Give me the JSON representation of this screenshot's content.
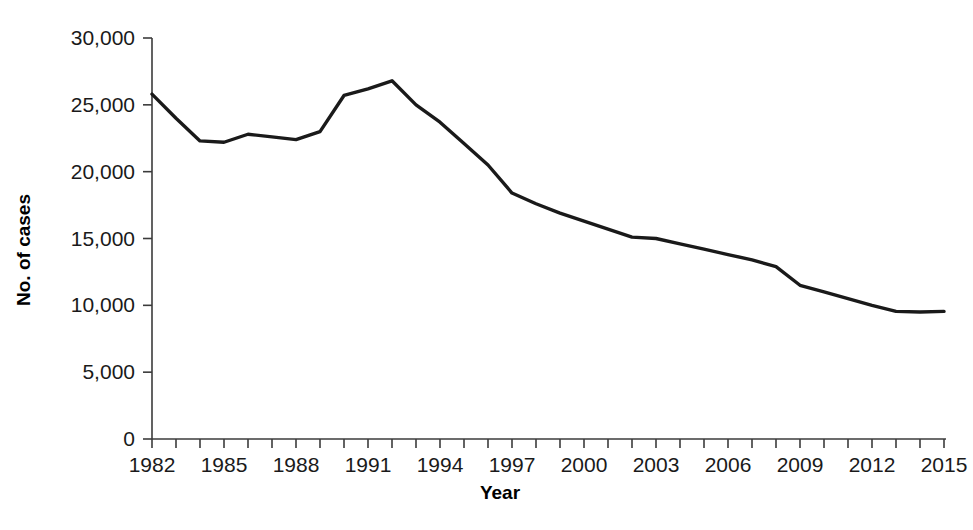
{
  "chart_data": {
    "type": "line",
    "title": "",
    "xlabel": "Year",
    "ylabel": "No. of cases",
    "xlim": [
      1982,
      2015
    ],
    "ylim": [
      0,
      30000
    ],
    "grid": false,
    "legend": null,
    "x_tick_labels": [
      "1982",
      "1985",
      "1988",
      "1991",
      "1994",
      "1997",
      "2000",
      "2003",
      "2006",
      "2009",
      "2012",
      "2015"
    ],
    "x_tick_values": [
      1982,
      1985,
      1988,
      1991,
      1994,
      1997,
      2000,
      2003,
      2006,
      2009,
      2012,
      2015
    ],
    "x_minor_ticks_every": 1,
    "y_tick_labels": [
      "0",
      "5,000",
      "10,000",
      "15,000",
      "20,000",
      "25,000",
      "30,000"
    ],
    "y_tick_values": [
      0,
      5000,
      10000,
      15000,
      20000,
      25000,
      30000
    ],
    "x": [
      1982,
      1983,
      1984,
      1985,
      1986,
      1987,
      1988,
      1989,
      1990,
      1991,
      1992,
      1993,
      1994,
      1995,
      1996,
      1997,
      1998,
      1999,
      2000,
      2001,
      2002,
      2003,
      2004,
      2005,
      2006,
      2007,
      2008,
      2009,
      2010,
      2011,
      2012,
      2013,
      2014,
      2015
    ],
    "series": [
      {
        "name": "No. of cases",
        "color": "#1a1a1a",
        "values": [
          25800,
          24000,
          22300,
          22200,
          22800,
          22600,
          22400,
          23000,
          25700,
          26200,
          26800,
          25000,
          23700,
          22100,
          20500,
          18400,
          17600,
          16900,
          16300,
          15700,
          15100,
          15000,
          14600,
          14200,
          13800,
          13400,
          12900,
          11500,
          11000,
          10500,
          10000,
          9550,
          9500,
          9550
        ]
      }
    ]
  },
  "axis_titles": {
    "x": "Year",
    "y": "No. of cases"
  },
  "footnote": {
    "text": ""
  },
  "colors": {
    "line": "#1a1a1a",
    "axis": "#3b3b3b",
    "background": "#ffffff",
    "tick_text": "#1a1a1a"
  }
}
